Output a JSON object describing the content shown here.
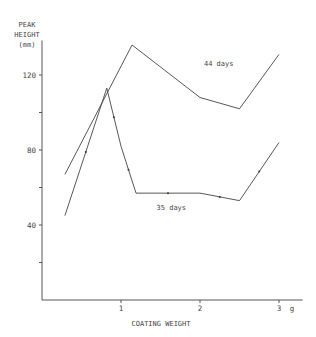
{
  "chart_data": {
    "type": "line",
    "title": "",
    "ylabel": [
      "PEAK",
      "HEIGHT",
      "(mm)"
    ],
    "xlabel": "COATING WEIGHT",
    "x_unit": "g",
    "xlim": [
      0,
      3.3
    ],
    "ylim": [
      0,
      140
    ],
    "yticks": [
      20,
      40,
      60,
      80,
      100,
      120
    ],
    "ytick_labels": [
      "",
      "40",
      "",
      "80",
      "",
      "120"
    ],
    "xticks": [
      1,
      2,
      3
    ],
    "xtick_labels": [
      "1",
      "2",
      "3"
    ],
    "grid": false,
    "series": [
      {
        "name": "44 days",
        "x": [
          0.29,
          1.14,
          2.0,
          2.5,
          3.0
        ],
        "y": [
          67,
          136,
          108,
          102,
          131
        ]
      },
      {
        "name": "35 days",
        "x": [
          0.29,
          0.82,
          1.0,
          1.19,
          2.0,
          2.5,
          3.0
        ],
        "y": [
          45,
          113,
          82,
          57,
          57,
          53,
          84
        ]
      }
    ],
    "annotations": [
      {
        "text": "44 days",
        "x": 2.05,
        "y": 125
      },
      {
        "text": "35 days",
        "x": 1.45,
        "y": 48
      }
    ]
  }
}
